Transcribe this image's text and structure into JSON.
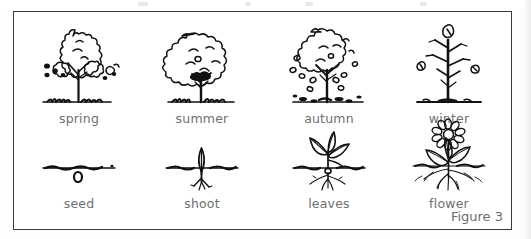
{
  "figure": {
    "caption": "Figure 3",
    "border_color": "#3a3a3a",
    "label_color": "#6f6f6f",
    "ink_color": "#111111",
    "background": "#ffffff"
  },
  "diagram": {
    "title_visible": false,
    "rows": [
      {
        "name": "tree-life-cycle-seasons",
        "cells": [
          {
            "id": "spring",
            "label": "spring",
            "art": "tree-sparse-blossom",
            "description": "young tree with sparse leaf clusters and scattered blossom dots on a grass line"
          },
          {
            "id": "summer",
            "label": "summer",
            "art": "tree-full-canopy",
            "description": "tree with full dense rounded canopy on a grass line"
          },
          {
            "id": "autumn",
            "label": "autumn",
            "art": "tree-falling-leaves",
            "description": "tree with thinning canopy, leaves falling and scattered on the ground"
          },
          {
            "id": "winter",
            "label": "winter",
            "art": "tree-bare-branches",
            "description": "bare tree with a few remaining leaves on the branches"
          }
        ]
      },
      {
        "name": "plant-life-cycle-stages",
        "cells": [
          {
            "id": "seed",
            "label": "seed",
            "art": "seed-in-soil",
            "description": "small oval seed just below the soil line"
          },
          {
            "id": "shoot",
            "label": "shoot",
            "art": "shoot-with-roots",
            "description": "small vertical sprout at the soil line with short roots below"
          },
          {
            "id": "leaves",
            "label": "leaves",
            "art": "seedling-with-leaves",
            "description": "seedling with several pointed leaves above ground and a spreading root system"
          },
          {
            "id": "flower",
            "label": "flower",
            "art": "flowering-plant",
            "description": "flowering plant with daisy-like bloom, leaves and deep roots"
          }
        ]
      }
    ]
  }
}
